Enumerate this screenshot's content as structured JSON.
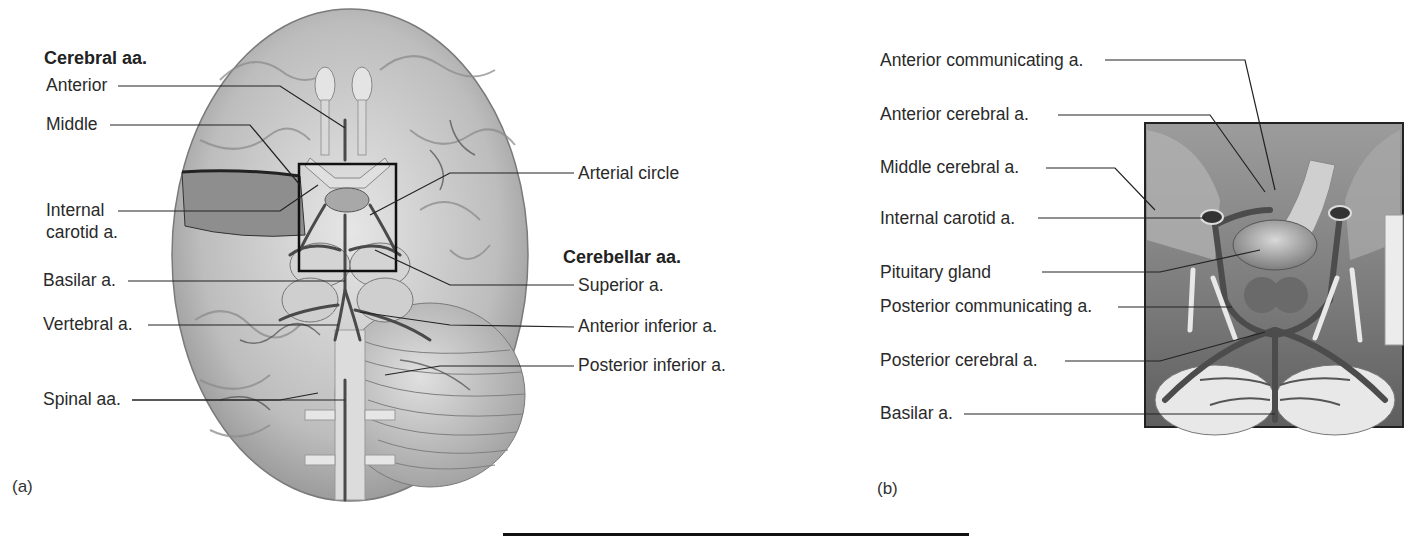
{
  "panel_a": {
    "letter": "(a)",
    "cerebral_header": "Cerebral aa.",
    "cerebral_labels": [
      "Anterior",
      "Middle",
      "Internal",
      "carotid a."
    ],
    "left_labels": [
      "Basilar a.",
      "Vertebral a.",
      "Spinal aa."
    ],
    "right_top_label": "Arterial circle",
    "cerebellar_header": "Cerebellar aa.",
    "cerebellar_labels": [
      "Superior a.",
      "Anterior inferior a.",
      "Posterior inferior a."
    ]
  },
  "panel_b": {
    "letter": "(b)",
    "labels": [
      "Anterior communicating a.",
      "Anterior cerebral a.",
      "Middle cerebral a.",
      "Internal carotid a.",
      "Pituitary gland",
      "Posterior communicating a.",
      "Posterior cerebral a.",
      "Basilar a."
    ]
  },
  "colors": {
    "background": "#ffffff",
    "leader_line": "#222222",
    "brain_light": "#d9d9d9",
    "brain_dark": "#8a8a8a",
    "vessel": "#4a4a4a"
  }
}
